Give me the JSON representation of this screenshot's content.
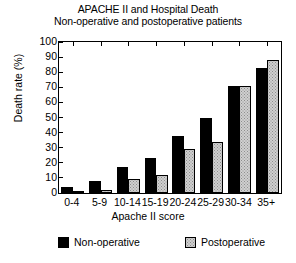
{
  "chart_data": {
    "type": "bar",
    "title": "APACHE II and Hospital Death",
    "subtitle": "Non-operative and postoperative patients",
    "xlabel": "Apache II score",
    "ylabel": "Death rate (%)",
    "ylim": [
      0,
      100
    ],
    "yticks": [
      0,
      10,
      20,
      30,
      40,
      50,
      60,
      70,
      80,
      90,
      100
    ],
    "ytick_labels": [
      "0",
      "10",
      "20",
      "30",
      "40",
      "50",
      "60",
      "70",
      "80",
      "90",
      "100"
    ],
    "grid": false,
    "legend_position": "bottom",
    "categories": [
      "0-4",
      "5-9",
      "10-14",
      "15-19",
      "20-24",
      "25-29",
      "30-34",
      "35+"
    ],
    "series": [
      {
        "name": "Non-operative",
        "color": "#000000",
        "values": [
          4,
          8,
          17,
          23,
          38,
          50,
          71,
          83
        ]
      },
      {
        "name": "Postoperative",
        "color": "#cfcfcf",
        "values": [
          1,
          2,
          9,
          12,
          29,
          34,
          71,
          88
        ]
      }
    ]
  },
  "legend": {
    "items": [
      {
        "label": "Non-operative",
        "swatch": "black-square-icon"
      },
      {
        "label": "Postoperative",
        "swatch": "stippled-square-icon"
      }
    ]
  }
}
